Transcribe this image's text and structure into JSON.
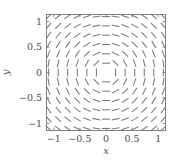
{
  "chart_data": {
    "type": "scatter",
    "plot_style": "direction-field",
    "title": "",
    "subtitle": "",
    "xlabel": "x",
    "ylabel": "y",
    "xlim": [
      -1.15,
      1.15
    ],
    "ylim": [
      -1.15,
      1.15
    ],
    "xticks": [
      -1,
      -0.5,
      0,
      0.5,
      1
    ],
    "yticks": [
      -1,
      -0.5,
      0,
      0.5,
      1
    ],
    "xticklabels": [
      "−1",
      "−0.5",
      "0",
      "0.5",
      "1"
    ],
    "yticklabels": [
      "−1",
      "−0.5",
      "0",
      "0.5",
      "1"
    ],
    "grid": false,
    "legend": null,
    "legend_position": "none",
    "annotations": [],
    "field": {
      "description": "Rotational (tangential) line field: each segment is tangent to a circle centred on the origin, i.e. direction (-y, x) normalised.",
      "grid_nx": 13,
      "grid_ny": 13,
      "grid_x_start": -1.1,
      "grid_x_end": 1.1,
      "grid_y_start": -1.1,
      "grid_y_end": 1.1,
      "segment_length_data": 0.155,
      "vector_formula_u": "-y / sqrt(x*x + y*y)",
      "vector_formula_v": "x / sqrt(x*x + y*y)",
      "segment_color": "#7a7a7a",
      "segment_width_px": 1.05
    },
    "colors": {
      "segment": "#7a7a7a",
      "frame": "#808080",
      "text": "#4d4d4d",
      "background": "#ffffff"
    }
  },
  "figure": {
    "axes_box_px": {
      "left": 46,
      "top": 14,
      "right": 166,
      "bottom": 131
    },
    "tick_length_px": 3.5
  }
}
